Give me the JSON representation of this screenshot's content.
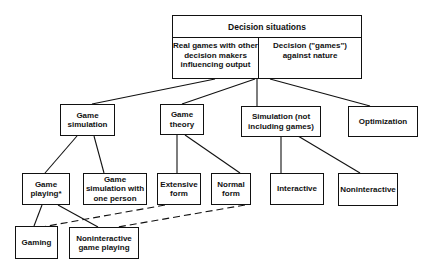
{
  "diagram": {
    "root": {
      "title": "Decision situations",
      "left_cell": "Real games with other decision makers influencing output",
      "right_cell": "Decision (\"games\") against nature"
    },
    "level1": {
      "game_simulation": "Game simulation",
      "game_theory": "Game theory",
      "simulation": "Simulation (not including games)",
      "optimization": "Optimization"
    },
    "level2": {
      "game_playing": "Game playing*",
      "game_sim_one_person": "Game simulation with one person",
      "extensive_form": "Extensive form",
      "normal_form": "Normal form",
      "interactive": "Interactive",
      "noninteractive": "Noninteractive"
    },
    "level3": {
      "gaming": "Gaming",
      "noninteractive_game_playing": "Noninteractive game playing"
    },
    "edges": [
      {
        "from": "root",
        "to": "game_simulation",
        "style": "solid"
      },
      {
        "from": "root",
        "to": "game_theory",
        "style": "solid"
      },
      {
        "from": "root",
        "to": "simulation",
        "style": "solid"
      },
      {
        "from": "root",
        "to": "optimization",
        "style": "solid"
      },
      {
        "from": "game_simulation",
        "to": "game_playing",
        "style": "solid"
      },
      {
        "from": "game_simulation",
        "to": "game_sim_one_person",
        "style": "solid"
      },
      {
        "from": "game_theory",
        "to": "extensive_form",
        "style": "solid"
      },
      {
        "from": "game_theory",
        "to": "normal_form",
        "style": "solid"
      },
      {
        "from": "simulation",
        "to": "interactive",
        "style": "solid"
      },
      {
        "from": "simulation",
        "to": "noninteractive",
        "style": "solid"
      },
      {
        "from": "game_playing",
        "to": "gaming",
        "style": "solid"
      },
      {
        "from": "game_playing",
        "to": "noninteractive_game_playing",
        "style": "solid"
      },
      {
        "from": "extensive_form",
        "to": "gaming",
        "style": "dashed"
      },
      {
        "from": "normal_form",
        "to": "noninteractive_game_playing",
        "style": "dashed"
      }
    ]
  }
}
